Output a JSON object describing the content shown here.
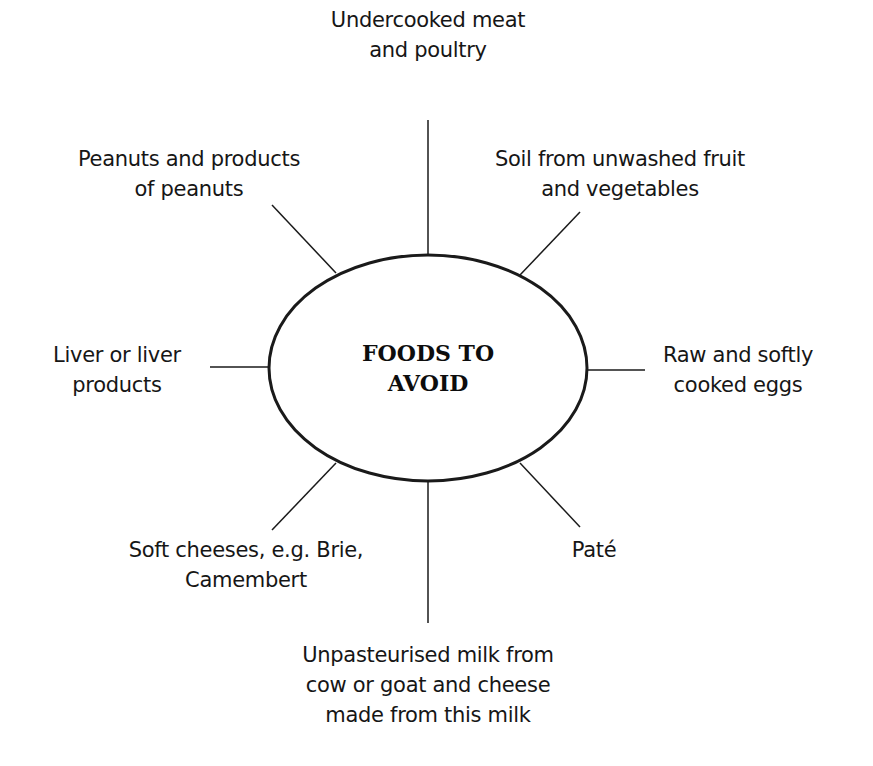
{
  "diagram": {
    "type": "spider-diagram",
    "center": {
      "line1": "FOODS TO",
      "line2": "AVOID"
    },
    "branches": [
      {
        "id": "top",
        "line1": "Undercooked meat",
        "line2": "and poultry"
      },
      {
        "id": "top-right",
        "line1": "Soil from unwashed fruit",
        "line2": "and vegetables"
      },
      {
        "id": "right",
        "line1": "Raw and softly",
        "line2": "cooked eggs"
      },
      {
        "id": "bottom-right",
        "line1": "Paté"
      },
      {
        "id": "bottom",
        "line1": "Unpasteurised milk from",
        "line2": "cow or goat and cheese",
        "line3": "made from this milk"
      },
      {
        "id": "bottom-left",
        "line1": "Soft cheeses, e.g. Brie,",
        "line2": "Camembert"
      },
      {
        "id": "left",
        "line1": "Liver or liver",
        "line2": "products"
      },
      {
        "id": "top-left",
        "line1": "Peanuts and products",
        "line2": "of peanuts"
      }
    ],
    "colors": {
      "line": "#1a1a1a",
      "text": "#161616",
      "background": "#ffffff"
    }
  }
}
